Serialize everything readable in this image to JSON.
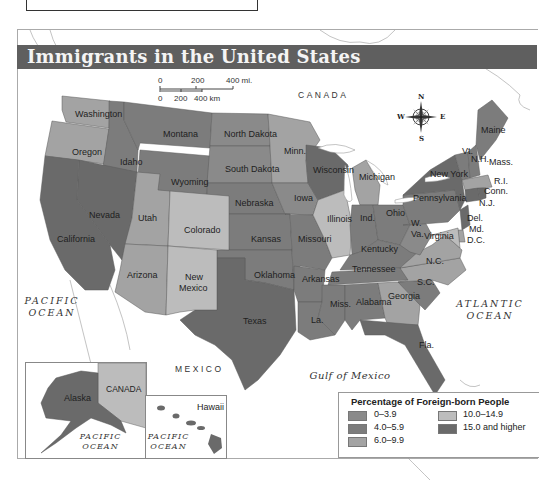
{
  "figure": {
    "title": "Immigrants in the United States"
  },
  "scale_bar": {
    "miles": [
      "0",
      "200",
      "400 mi."
    ],
    "km": [
      "0",
      "200",
      "400 km"
    ]
  },
  "compass": {
    "n": "N",
    "s": "S",
    "e": "E",
    "w": "W"
  },
  "place_labels": {
    "canada": "CANADA",
    "mexico": "MEXICO",
    "pacific_ocean": "PACIFIC OCEAN",
    "atlantic_ocean": "ATLANTIC OCEAN",
    "gulf": "Gulf of Mexico",
    "inset_canada": "CANADA",
    "inset_pacific_1": "PACIFIC OCEAN",
    "inset_pacific_2": "PACIFIC OCEAN"
  },
  "legend": {
    "title": "Percentage of Foreign-born People",
    "items": [
      {
        "label": "0–3.9",
        "color": "#8a8a8a"
      },
      {
        "label": "4.0–5.9",
        "color": "#7c7c7c"
      },
      {
        "label": "6.0–9.9",
        "color": "#a3a3a3"
      },
      {
        "label": "10.0–14.9",
        "color": "#bcbcbc"
      },
      {
        "label": "15.0 and higher",
        "color": "#6a6a6a"
      }
    ]
  },
  "states": {
    "washington": "Washington",
    "oregon": "Oregon",
    "idaho": "Idaho",
    "montana": "Montana",
    "wyoming": "Wyoming",
    "north_dakota": "North Dakota",
    "south_dakota": "South Dakota",
    "nebraska": "Nebraska",
    "kansas": "Kansas",
    "oklahoma": "Oklahoma",
    "texas": "Texas",
    "nevada": "Nevada",
    "california": "California",
    "utah": "Utah",
    "colorado": "Colorado",
    "arizona": "Arizona",
    "new_mexico_1": "New",
    "new_mexico_2": "Mexico",
    "minnesota": "Minn.",
    "iowa": "Iowa",
    "missouri": "Missouri",
    "arkansas": "Arkansas",
    "louisiana": "La.",
    "wisconsin": "Wisconsin",
    "illinois": "Illinois",
    "michigan": "Michigan",
    "indiana": "Ind.",
    "ohio": "Ohio",
    "kentucky": "Kentucky",
    "tennessee": "Tennessee",
    "mississippi": "Miss.",
    "alabama": "Alabama",
    "georgia": "Georgia",
    "florida": "Fla.",
    "south_carolina": "S.C.",
    "north_carolina": "N.C.",
    "virginia": "Virginia",
    "west_virginia_1": "W.",
    "west_virginia_2": "Va.",
    "pennsylvania": "Pennsylvania",
    "new_york": "New York",
    "vermont": "Vt.",
    "new_hampshire": "N.H.",
    "maine": "Maine",
    "massachusetts": "Mass.",
    "rhode_island": "R.I.",
    "connecticut": "Conn.",
    "new_jersey": "N.J.",
    "delaware": "Del.",
    "maryland": "Md.",
    "dc": "D.C.",
    "alaska": "Alaska",
    "hawaii": "Hawaii"
  }
}
